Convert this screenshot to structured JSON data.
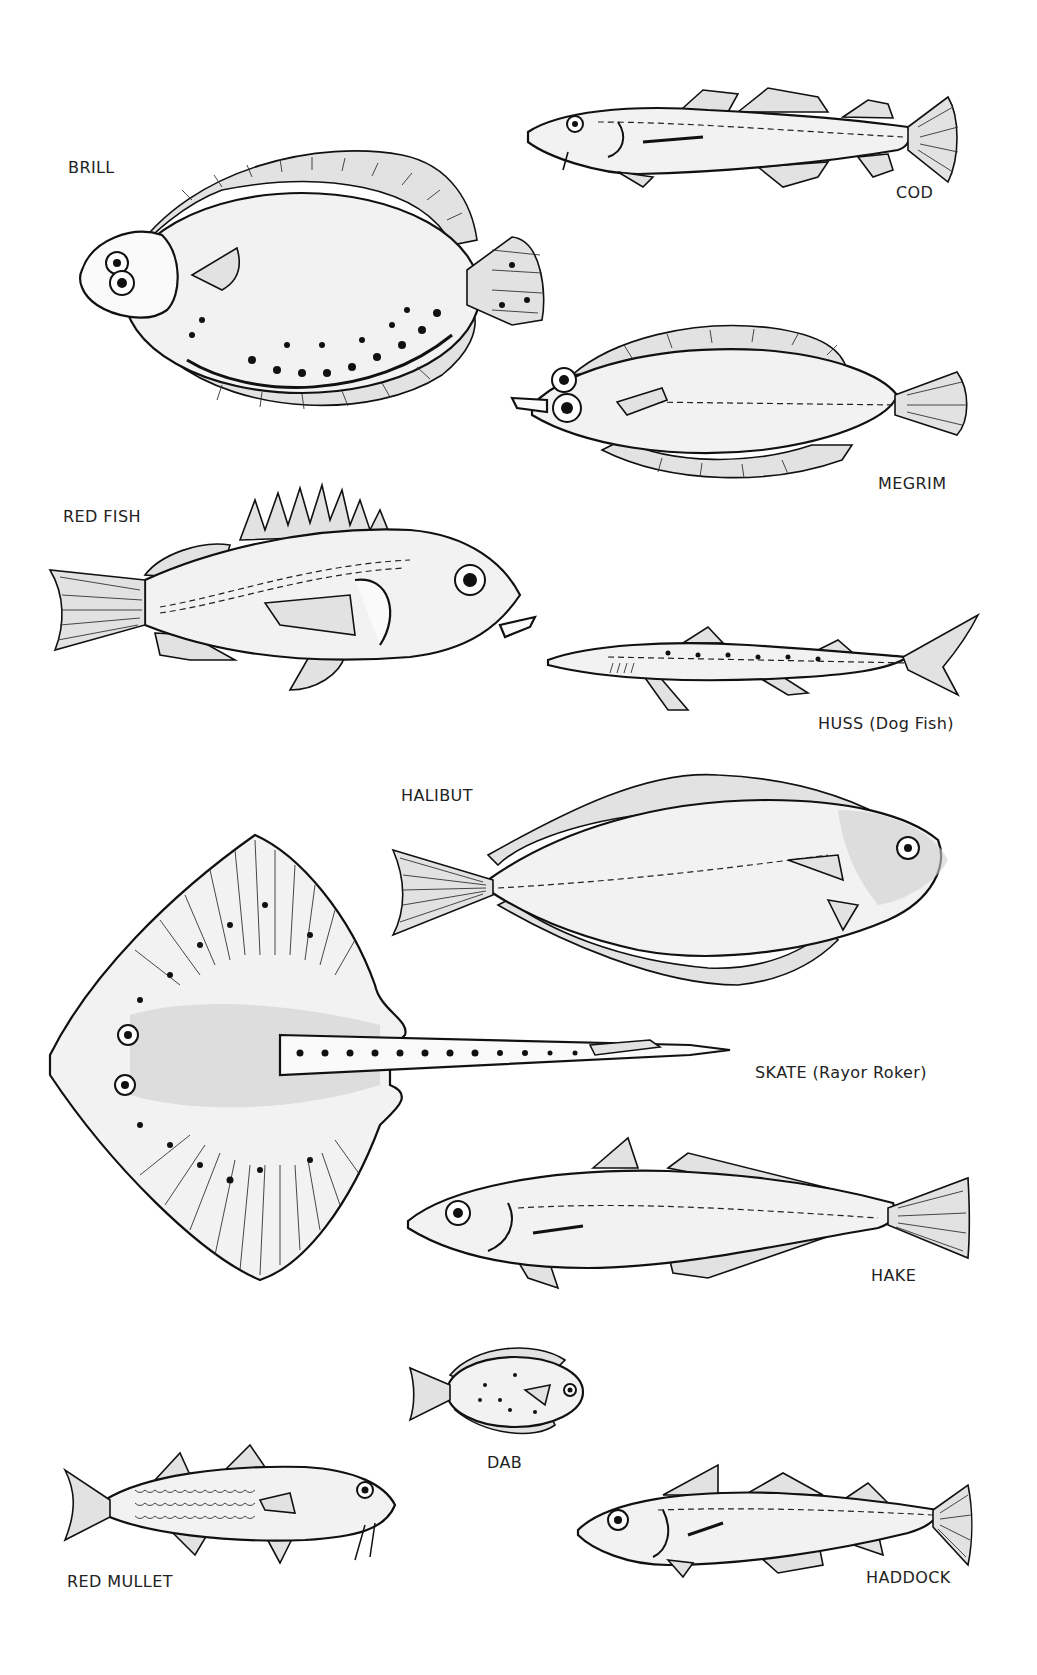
{
  "plate": {
    "title": "",
    "background": "#ffffff",
    "ink_color": "#111111"
  },
  "fish": [
    {
      "id": "brill",
      "label": "BRILL"
    },
    {
      "id": "cod",
      "label": "COD"
    },
    {
      "id": "megrim",
      "label": "MEGRIM"
    },
    {
      "id": "redfish",
      "label": "RED FISH"
    },
    {
      "id": "huss",
      "label": "HUSS (Dog Fish)"
    },
    {
      "id": "halibut",
      "label": "HALIBUT"
    },
    {
      "id": "skate",
      "label": "SKATE (Rayor Roker)"
    },
    {
      "id": "hake",
      "label": "HAKE"
    },
    {
      "id": "dab",
      "label": "DAB"
    },
    {
      "id": "redmullet",
      "label": "RED MULLET"
    },
    {
      "id": "haddock",
      "label": "HADDOCK"
    }
  ]
}
